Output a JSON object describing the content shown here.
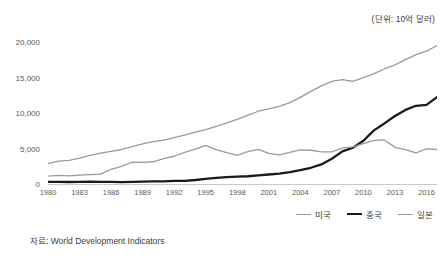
{
  "figure": {
    "unit_caption": "(단위: 10억 달러)",
    "source_note": "자료: World Development Indicators"
  },
  "chart_data": {
    "type": "line",
    "title": "",
    "subtitle": "",
    "xlabel": "",
    "ylabel": "",
    "unit_note": "(단위: 10억 달러)",
    "source": "자료: World Development Indicators",
    "grid": false,
    "legend_position": "bottom-right",
    "xlim": [
      1980,
      2017
    ],
    "ylim": [
      0,
      20000
    ],
    "ytick_labels": [
      "0",
      "5,000",
      "10,000",
      "15,000",
      "20,000"
    ],
    "yticks": [
      0,
      5000,
      10000,
      15000,
      20000
    ],
    "xtick_labels": [
      "1980",
      "1983",
      "1986",
      "1989",
      "1992",
      "1995",
      "1998",
      "2001",
      "2004",
      "2007",
      "2010",
      "2013",
      "2016"
    ],
    "xticks": [
      1980,
      1983,
      1986,
      1989,
      1992,
      1995,
      1998,
      2001,
      2004,
      2007,
      2010,
      2013,
      2016
    ],
    "x": [
      1980,
      1981,
      1982,
      1983,
      1984,
      1985,
      1986,
      1987,
      1988,
      1989,
      1990,
      1991,
      1992,
      1993,
      1994,
      1995,
      1996,
      1997,
      1998,
      1999,
      2000,
      2001,
      2002,
      2003,
      2004,
      2005,
      2006,
      2007,
      2008,
      2009,
      2010,
      2011,
      2012,
      2013,
      2014,
      2015,
      2016,
      2017
    ],
    "series": [
      {
        "name": "미국",
        "color": "#9a9a9a",
        "width": 1.3,
        "values": [
          2860,
          3210,
          3340,
          3630,
          4040,
          4340,
          4580,
          4860,
          5250,
          5660,
          5980,
          6170,
          6540,
          6880,
          7310,
          7660,
          8100,
          8610,
          9090,
          9660,
          10250,
          10580,
          10940,
          11460,
          12210,
          13040,
          13820,
          14450,
          14710,
          14450,
          14990,
          15540,
          16200,
          16780,
          17520,
          18220,
          18710,
          19490
        ]
      },
      {
        "name": "중국",
        "color": "#1a1a1a",
        "width": 2.3,
        "values": [
          303,
          289,
          284,
          305,
          314,
          310,
          301,
          273,
          312,
          348,
          361,
          383,
          427,
          445,
          564,
          735,
          864,
          962,
          1030,
          1094,
          1211,
          1339,
          1471,
          1660,
          1955,
          2286,
          2752,
          3550,
          4594,
          5102,
          6087,
          7552,
          8532,
          9570,
          10438,
          11016,
          11138,
          12240
        ]
      },
      {
        "name": "일본",
        "color": "#9a9a9a",
        "width": 1.3,
        "values": [
          1105,
          1218,
          1134,
          1244,
          1318,
          1399,
          2076,
          2497,
          3072,
          3055,
          3133,
          3585,
          3909,
          4455,
          4908,
          5449,
          4834,
          4415,
          4040,
          4563,
          4888,
          4304,
          4115,
          4446,
          4815,
          4755,
          4530,
          4515,
          5038,
          5231,
          5700,
          6157,
          6203,
          5156,
          4850,
          4395,
          4940,
          4860
        ]
      }
    ]
  }
}
